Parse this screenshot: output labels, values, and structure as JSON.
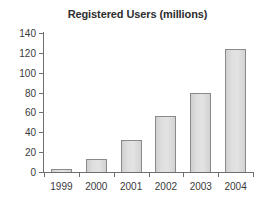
{
  "chart_data": {
    "type": "bar",
    "title": "Registered Users (millions)",
    "xlabel": "",
    "ylabel": "",
    "categories": [
      "1999",
      "2000",
      "2001",
      "2002",
      "2003",
      "2004"
    ],
    "values": [
      3,
      13,
      32,
      56,
      80,
      124
    ],
    "ylim": [
      0,
      140
    ],
    "yticks": [
      0,
      20,
      40,
      60,
      80,
      100,
      120,
      140
    ],
    "ytick_labels": [
      "0",
      "20",
      "40",
      "60",
      "80",
      "100",
      "120",
      "140"
    ],
    "grid": false,
    "legend": null,
    "series": [
      {
        "name": "Registered Users (millions)",
        "values": [
          3,
          13,
          32,
          56,
          80,
          124
        ]
      }
    ],
    "colors": {
      "bar_fill": "#dcdcdc",
      "bar_edge": "#8a8a8a",
      "axis": "#6f6f6f",
      "text": "#3a3a3a",
      "background": "#ffffff"
    }
  }
}
